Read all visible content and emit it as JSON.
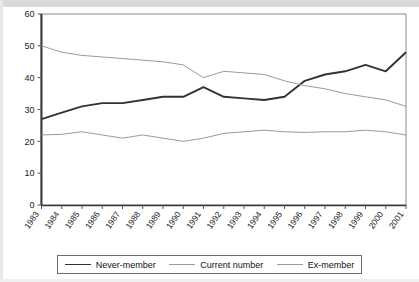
{
  "chart_data": {
    "type": "line",
    "title": "",
    "xlabel": "",
    "ylabel": "",
    "ylim": [
      0,
      60
    ],
    "y_ticks": [
      0,
      10,
      20,
      30,
      40,
      50,
      60
    ],
    "grid": false,
    "legend_position": "bottom",
    "categories": [
      "1983",
      "1984",
      "1985",
      "1986",
      "1987",
      "1988",
      "1989",
      "1990",
      "1991",
      "1992",
      "1993",
      "1994",
      "1995",
      "1996",
      "1997",
      "1998",
      "1999",
      "2000",
      "2001"
    ],
    "series": [
      {
        "name": "Never-member",
        "color": "#333333",
        "values": [
          27,
          29,
          31,
          32,
          32,
          33,
          34,
          34,
          37,
          34,
          33.5,
          33,
          34,
          39,
          41,
          42,
          44,
          42,
          48
        ]
      },
      {
        "name": "Current number",
        "color": "#9a9a9a",
        "values": [
          50,
          48,
          47,
          46.5,
          46,
          45.5,
          45,
          44,
          40,
          42,
          41.5,
          41,
          39,
          37.5,
          36.5,
          35,
          34,
          33,
          31
        ]
      },
      {
        "name": "Ex-member",
        "color": "#9a9a9a",
        "values": [
          22,
          22.2,
          23,
          22,
          21,
          22,
          21,
          20,
          21,
          22.5,
          23,
          23.5,
          23,
          22.8,
          23,
          23,
          23.5,
          23,
          22
        ]
      }
    ]
  },
  "axes": {
    "y_tick_labels": [
      "60",
      "50",
      "40",
      "30",
      "20",
      "10",
      "0"
    ],
    "x_tick_labels": [
      "1983",
      "1984",
      "1985",
      "1986",
      "1987",
      "1988",
      "1989",
      "1990",
      "1991",
      "1992",
      "1993",
      "1994",
      "1995",
      "1996",
      "1997",
      "1998",
      "1999",
      "2000",
      "2001"
    ]
  },
  "legend": {
    "items": [
      {
        "label": "Never-member"
      },
      {
        "label": "Current number"
      },
      {
        "label": "Ex-member"
      }
    ]
  }
}
